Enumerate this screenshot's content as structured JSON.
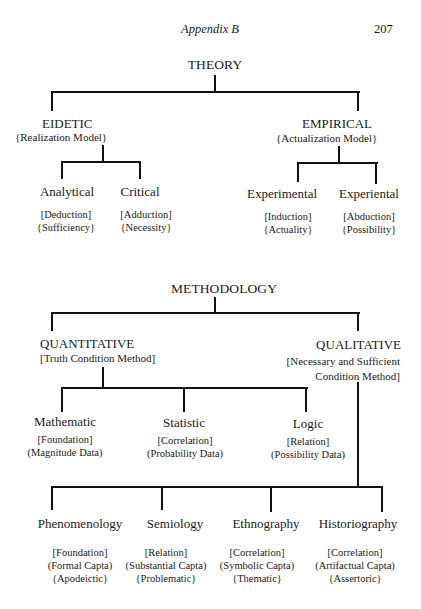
{
  "page_header": {
    "running_title": "Appendix B",
    "page_number": "207"
  },
  "theory": {
    "root": "THEORY",
    "branches": [
      {
        "label": "EIDETIC",
        "model": "{Realization Model}",
        "children": [
          {
            "label": "Analytical",
            "lines": [
              "[Deduction]",
              "{Sufficiency}"
            ]
          },
          {
            "label": "Critical",
            "lines": [
              "[Adduction]",
              "{Necessity}"
            ]
          }
        ]
      },
      {
        "label": "EMPIRICAL",
        "model": "{Actualization Model}",
        "children": [
          {
            "label": "Experimental",
            "lines": [
              "[Induction]",
              "{Actuality}"
            ]
          },
          {
            "label": "Experiental",
            "lines": [
              "[Abduction]",
              "{Possibility}"
            ]
          }
        ]
      }
    ]
  },
  "methodology": {
    "root": "METHODOLOGY",
    "quantitative": {
      "label": "QUANTITATIVE",
      "method": "[Truth Condition Method]",
      "children": [
        {
          "label": "Mathematic",
          "lines": [
            "[Foundation]",
            "(Magnitude Data)"
          ]
        },
        {
          "label": "Statistic",
          "lines": [
            "[Correlation]",
            "(Probability Data)"
          ]
        },
        {
          "label": "Logic",
          "lines": [
            "[Relation]",
            "(Possibility Data)"
          ]
        }
      ]
    },
    "qualitative": {
      "label": "QUALITATIVE",
      "method_line1": "[Necessary and Sufficient",
      "method_line2": "Condition Method]",
      "children": [
        {
          "label": "Phenomenology",
          "lines": [
            "[Foundation]",
            "(Formal Capta)",
            "{Apodeictic}"
          ]
        },
        {
          "label": "Semiology",
          "lines": [
            "[Relation]",
            "(Substantial Capta)",
            "{Problematic}"
          ]
        },
        {
          "label": "Ethnography",
          "lines": [
            "[Correlation]",
            "(Symbolic Capta)",
            "{Thematic}"
          ]
        },
        {
          "label": "Historiography",
          "lines": [
            "[Correlation]",
            "(Artifactual Capta)",
            "{Assertoric}"
          ]
        }
      ]
    }
  }
}
